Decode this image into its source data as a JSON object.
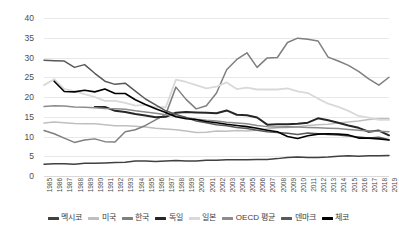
{
  "chart_data": {
    "type": "line",
    "title": "",
    "subtitle": "",
    "xlabel": "",
    "ylabel": "",
    "ylim": [
      0,
      40
    ],
    "ytick_step": 5,
    "ytick_labels": [
      "40",
      "35",
      "30",
      "25",
      "20",
      "15",
      "10",
      "5",
      "0"
    ],
    "grid": true,
    "legend_position": "bottom",
    "x": [
      "1985",
      "1986",
      "1987",
      "1988",
      "1989",
      "1990",
      "1991",
      "1992",
      "1993",
      "1994",
      "1995",
      "1996",
      "1997",
      "1998",
      "1999",
      "2000",
      "2001",
      "2002",
      "2003",
      "2004",
      "2005",
      "2006",
      "2007",
      "2008",
      "2009",
      "2010",
      "2011",
      "2012",
      "2013",
      "2014",
      "2015",
      "2016",
      "2017",
      "2018",
      "2019"
    ],
    "series": [
      {
        "name": "멕시코",
        "color": "#404040",
        "width": 1.5,
        "values": [
          3.0,
          3.1,
          3.1,
          3.0,
          3.2,
          3.2,
          3.3,
          3.4,
          3.5,
          3.8,
          3.8,
          3.7,
          3.8,
          3.9,
          3.8,
          3.8,
          4.0,
          4.0,
          4.1,
          4.1,
          4.1,
          4.2,
          4.2,
          4.4,
          4.7,
          4.8,
          4.7,
          4.7,
          4.8,
          5.0,
          5.1,
          5.0,
          5.1,
          5.1,
          5.2
        ]
      },
      {
        "name": "미국",
        "color": "#bfbfbf",
        "width": 1.5,
        "values": [
          13.4,
          13.7,
          13.5,
          13.3,
          13.2,
          13.2,
          13.0,
          12.7,
          12.7,
          12.6,
          12.4,
          12.1,
          11.9,
          11.7,
          11.4,
          11.0,
          11.1,
          11.4,
          11.3,
          11.5,
          11.4,
          11.6,
          11.9,
          12.2,
          12.3,
          12.5,
          12.8,
          13.0,
          13.1,
          13.4,
          13.7,
          13.9,
          14.3,
          14.5,
          14.5
        ]
      },
      {
        "name": "한국",
        "color": "#7f7f7f",
        "width": 1.5,
        "values": [
          11.5,
          10.7,
          9.6,
          8.5,
          9.1,
          9.4,
          8.7,
          8.6,
          11.2,
          11.7,
          12.8,
          14.2,
          15.6,
          22.5,
          19.4,
          17.0,
          17.8,
          21.0,
          26.9,
          29.5,
          31.2,
          27.5,
          29.9,
          30.0,
          33.8,
          34.9,
          34.6,
          34.2,
          30.1,
          29.1,
          28.0,
          26.5,
          24.6,
          23.0,
          25.0
        ]
      },
      {
        "name": "독일",
        "color": "#262626",
        "width": 2.0,
        "values": [
          null,
          null,
          null,
          null,
          null,
          17.5,
          17.5,
          16.5,
          16.2,
          15.7,
          15.3,
          14.9,
          15.0,
          16.0,
          16.2,
          16.1,
          16.0,
          15.9,
          16.6,
          15.5,
          15.4,
          14.8,
          13.0,
          13.1,
          13.1,
          13.2,
          13.5,
          14.6,
          14.1,
          13.5,
          12.8,
          12.2,
          11.2,
          11.5,
          10.3
        ]
      },
      {
        "name": "일본",
        "color": "#d9d9d9",
        "width": 1.8,
        "values": [
          23.0,
          24.5,
          22.0,
          21.5,
          20.7,
          20.0,
          19.0,
          19.0,
          18.5,
          17.8,
          18.0,
          17.4,
          17.4,
          24.4,
          23.8,
          23.0,
          22.2,
          22.6,
          23.7,
          22.0,
          22.4,
          21.9,
          21.9,
          21.9,
          22.2,
          21.4,
          21.0,
          19.6,
          18.3,
          17.5,
          16.5,
          15.2,
          14.8,
          14.2,
          14.2
        ]
      },
      {
        "name": "OECD 평균",
        "color": "#8c8c8c",
        "width": 1.5,
        "values": [
          17.6,
          17.8,
          17.7,
          17.5,
          17.4,
          17.3,
          17.1,
          17.0,
          16.9,
          16.5,
          16.2,
          15.9,
          15.5,
          15.2,
          14.8,
          14.4,
          14.1,
          13.9,
          13.6,
          13.4,
          13.2,
          12.8,
          12.5,
          12.4,
          12.5,
          12.4,
          12.3,
          12.2,
          12.1,
          12.0,
          11.8,
          11.6,
          11.4,
          11.3,
          11.2
        ]
      },
      {
        "name": "덴마크",
        "color": "#595959",
        "width": 1.5,
        "values": [
          29.3,
          29.2,
          29.1,
          27.5,
          28.2,
          26.0,
          24.0,
          23.2,
          23.5,
          21.5,
          19.5,
          18.0,
          16.5,
          15.6,
          14.8,
          13.9,
          13.5,
          13.0,
          12.7,
          12.3,
          12.0,
          11.6,
          11.2,
          11.0,
          10.8,
          10.5,
          10.9,
          10.7,
          10.5,
          10.4,
          10.1,
          9.9,
          9.6,
          9.8,
          9.2
        ]
      },
      {
        "name": "체코",
        "color": "#000000",
        "width": 1.6,
        "values": [
          null,
          24.0,
          21.4,
          21.3,
          21.7,
          21.3,
          22.0,
          20.9,
          20.9,
          19.3,
          18.1,
          17.0,
          16.1,
          15.0,
          14.5,
          14.3,
          13.8,
          13.5,
          13.1,
          12.8,
          12.5,
          12.1,
          11.6,
          11.2,
          10.0,
          9.5,
          10.2,
          10.6,
          10.7,
          10.6,
          10.4,
          9.6,
          9.6,
          9.4,
          9.1
        ]
      }
    ]
  },
  "legend": {
    "items": [
      {
        "label": "멕시코",
        "color": "#404040"
      },
      {
        "label": "미국",
        "color": "#bfbfbf"
      },
      {
        "label": "한국",
        "color": "#7f7f7f"
      },
      {
        "label": "독일",
        "color": "#262626"
      },
      {
        "label": "일본",
        "color": "#d9d9d9"
      },
      {
        "label": "OECD 평균",
        "color": "#8c8c8c"
      },
      {
        "label": "덴마크",
        "color": "#595959"
      },
      {
        "label": "체코",
        "color": "#000000"
      }
    ]
  }
}
